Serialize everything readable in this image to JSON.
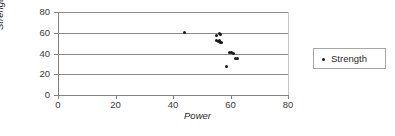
{
  "chart_data": {
    "type": "scatter",
    "title": "",
    "xlabel": "Power",
    "ylabel": "Strength",
    "xlim": [
      0,
      80
    ],
    "ylim": [
      0,
      80
    ],
    "xticks": [
      0,
      20,
      40,
      60,
      80
    ],
    "yticks": [
      0,
      20,
      40,
      60,
      80
    ],
    "grid": "horizontal",
    "legend_position": "right",
    "series": [
      {
        "name": "Strength",
        "marker": "dot",
        "color": "#1a1a1a",
        "points": [
          [
            44.0,
            60.0
          ],
          [
            55.0,
            57.5
          ],
          [
            56.3,
            59.0
          ],
          [
            56.6,
            58.0
          ],
          [
            55.2,
            52.5
          ],
          [
            55.8,
            51.5
          ],
          [
            56.2,
            52.8
          ],
          [
            56.5,
            51.0
          ],
          [
            57.0,
            50.5
          ],
          [
            59.8,
            41.0
          ],
          [
            60.5,
            40.5
          ],
          [
            61.0,
            40.0
          ],
          [
            61.6,
            35.0
          ],
          [
            62.4,
            35.0
          ],
          [
            58.5,
            27.0
          ]
        ]
      }
    ]
  },
  "legend": {
    "items": [
      {
        "label": "Strength",
        "marker": "dot"
      }
    ]
  },
  "axes": {
    "y_tick_labels": [
      "80",
      "60",
      "40",
      "20",
      "0"
    ],
    "x_tick_labels": [
      "0",
      "20",
      "40",
      "60",
      "80"
    ],
    "y_title": "Strength",
    "x_title": "Power"
  }
}
